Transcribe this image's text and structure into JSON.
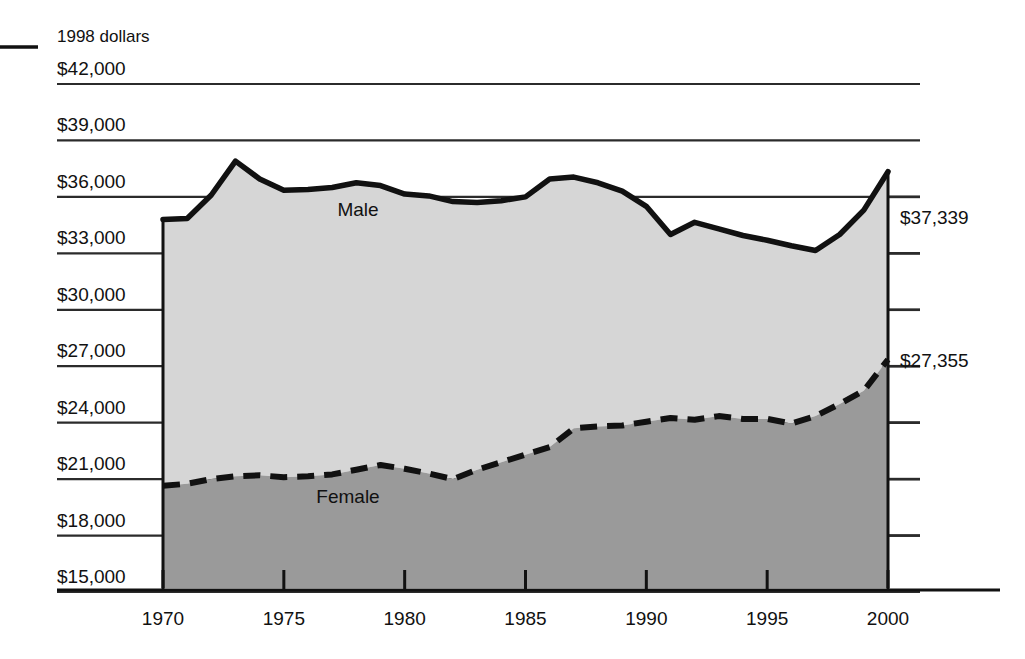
{
  "chart_data": {
    "type": "area",
    "title": "",
    "subtitle": "",
    "unit_note": "1998 dollars",
    "xlabel": "",
    "ylabel": "",
    "xlim": [
      1969,
      2000
    ],
    "ylim": [
      15000,
      42000
    ],
    "grid": true,
    "legend_position": "inline-labels",
    "y_ticks": [
      "$42,000",
      "$39,000",
      "$36,000",
      "$33,000",
      "$30,000",
      "$27,000",
      "$24,000",
      "$21,000",
      "$18,000",
      "$15,000"
    ],
    "y_tick_values": [
      42000,
      39000,
      36000,
      33000,
      30000,
      27000,
      24000,
      21000,
      18000,
      15000
    ],
    "x_ticks": [
      "1970",
      "1975",
      "1980",
      "1985",
      "1990",
      "1995",
      "2000"
    ],
    "x_tick_values": [
      1970,
      1975,
      1980,
      1985,
      1990,
      1995,
      2000
    ],
    "x": [
      1970,
      1971,
      1972,
      1973,
      1974,
      1975,
      1976,
      1977,
      1978,
      1979,
      1980,
      1981,
      1982,
      1983,
      1984,
      1985,
      1986,
      1987,
      1988,
      1989,
      1990,
      1991,
      1992,
      1993,
      1994,
      1995,
      1996,
      1997,
      1998,
      1999,
      2000
    ],
    "series": [
      {
        "name": "Male",
        "style": "solid",
        "fill_color": "#d6d6d6",
        "line_color": "#111111",
        "end_label": "$37,339",
        "values": [
          34800,
          34850,
          36100,
          37900,
          36950,
          36350,
          36400,
          36500,
          36750,
          36600,
          36150,
          36050,
          35750,
          35700,
          35800,
          36000,
          36950,
          37050,
          36750,
          36300,
          35500,
          34000,
          34650,
          34300,
          33950,
          33700,
          33400,
          33150,
          34000,
          35300,
          37339
        ]
      },
      {
        "name": "Female",
        "style": "dashed",
        "fill_color": "#9a9a9a",
        "line_color": "#111111",
        "end_label": "$27,355",
        "values": [
          20650,
          20750,
          21000,
          21150,
          21200,
          21100,
          21150,
          21250,
          21500,
          21750,
          21550,
          21300,
          21000,
          21500,
          21900,
          22300,
          22700,
          23700,
          23800,
          23850,
          24050,
          24250,
          24150,
          24350,
          24200,
          24200,
          23950,
          24350,
          25000,
          25700,
          27355
        ]
      }
    ],
    "series_labels": [
      {
        "text": "Male",
        "x_px": 358,
        "y_px": 216
      },
      {
        "text": "Female",
        "x_px": 348,
        "y_px": 503
      }
    ],
    "end_labels": [
      {
        "text": "$37,339",
        "value": 37339,
        "series": "Male"
      },
      {
        "text": "$27,355",
        "value": 27355,
        "series": "Female"
      }
    ],
    "colors": {
      "male_fill": "#d6d6d6",
      "female_fill": "#9a9a9a",
      "line": "#111111",
      "grid": "#2b2b2b",
      "background": "#ffffff"
    },
    "left_rule": {
      "present": true
    }
  }
}
